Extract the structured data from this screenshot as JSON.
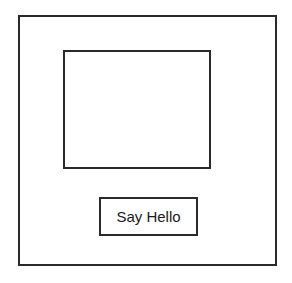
{
  "window": {
    "panel": {},
    "button": {
      "label": "Say Hello"
    }
  }
}
